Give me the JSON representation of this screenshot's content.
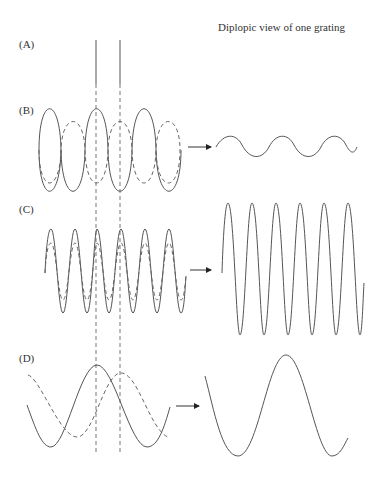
{
  "figure": {
    "title": "Diplopic view of one grating",
    "panels": [
      {
        "id": "A",
        "label": "(A)"
      },
      {
        "id": "B",
        "label": "(B)"
      },
      {
        "id": "C",
        "label": "(C)"
      },
      {
        "id": "D",
        "label": "(D)"
      }
    ],
    "icons": {
      "arrow": "right-arrow-icon"
    },
    "colors": {
      "line": "#555555",
      "background": "#ffffff"
    }
  }
}
